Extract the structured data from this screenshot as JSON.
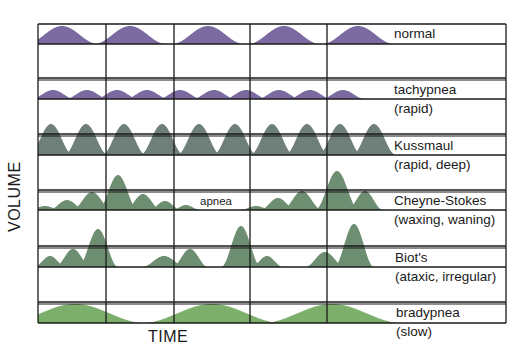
{
  "axes": {
    "x_label": "TIME",
    "y_label": "VOLUME"
  },
  "annotation": {
    "apnea": "apnea"
  },
  "colors": {
    "purple": "#7a6aa0",
    "slate": "#6f7f7a",
    "green_gray": "#6e8e72",
    "green": "#7cae6c",
    "grid": "#1a1a1a"
  },
  "patterns": [
    {
      "id": "normal",
      "name": "normal",
      "description": ""
    },
    {
      "id": "tachypnea",
      "name": "tachypnea",
      "description": "(rapid)"
    },
    {
      "id": "kussmaul",
      "name": "Kussmaul",
      "description": "(rapid, deep)"
    },
    {
      "id": "cheyne-stokes",
      "name": "Cheyne-Stokes",
      "description": "(waxing, waning)"
    },
    {
      "id": "biots",
      "name": "Biot's",
      "description": "(ataxic, irregular)"
    },
    {
      "id": "bradypnea",
      "name": "bradypnea",
      "description": "(slow)"
    }
  ],
  "chart_data": {
    "type": "diagram",
    "xlabel": "TIME",
    "ylabel": "VOLUME",
    "grid": true,
    "rows": [
      {
        "name": "normal",
        "description": "",
        "color": "#7a6aa0",
        "baseline_y": 44,
        "peaks": [
          [
            62,
            18,
            36
          ],
          [
            130,
            18,
            36
          ],
          [
            208,
            18,
            36
          ],
          [
            284,
            18,
            36
          ],
          [
            358,
            18,
            36
          ]
        ]
      },
      {
        "name": "tachypnea",
        "description": "(rapid)",
        "color": "#7a6aa0",
        "baseline_y": 99,
        "peaks": [
          [
            53,
            9,
            22
          ],
          [
            87,
            9,
            22
          ],
          [
            117,
            9,
            22
          ],
          [
            147,
            9,
            22
          ],
          [
            180,
            9,
            22
          ],
          [
            214,
            9,
            22
          ],
          [
            246,
            9,
            22
          ],
          [
            279,
            9,
            22
          ],
          [
            310,
            9,
            22
          ],
          [
            343,
            9,
            22
          ]
        ]
      },
      {
        "name": "Kussmaul",
        "description": "(rapid, deep)",
        "color": "#6f7f7a",
        "baseline_y": 155,
        "peaks": [
          [
            51,
            31,
            22
          ],
          [
            86,
            31,
            22
          ],
          [
            124,
            31,
            22
          ],
          [
            162,
            31,
            22
          ],
          [
            199,
            31,
            22
          ],
          [
            235,
            31,
            22
          ],
          [
            272,
            31,
            22
          ],
          [
            307,
            31,
            22
          ],
          [
            340,
            31,
            22
          ],
          [
            374,
            31,
            22
          ]
        ]
      },
      {
        "name": "Cheyne-Stokes",
        "description": "(waxing, waning)",
        "color": "#6e8e72",
        "baseline_y": 210,
        "peaks": [
          [
            45,
            4,
            16
          ],
          [
            67,
            10,
            18
          ],
          [
            92,
            18,
            20
          ],
          [
            118,
            35,
            20
          ],
          [
            143,
            16,
            18
          ],
          [
            165,
            9,
            16
          ],
          [
            186,
            5,
            14
          ],
          [
            256,
            4,
            16
          ],
          [
            278,
            12,
            18
          ],
          [
            302,
            19,
            20
          ],
          [
            337,
            39,
            22
          ],
          [
            365,
            19,
            18
          ]
        ]
      },
      {
        "name": "Biot's",
        "description": "(ataxic, irregular)",
        "color": "#6e8e72",
        "baseline_y": 267,
        "peaks": [
          [
            50,
            11,
            16
          ],
          [
            73,
            18,
            18
          ],
          [
            98,
            38,
            20
          ],
          [
            164,
            11,
            22
          ],
          [
            190,
            18,
            18
          ],
          [
            241,
            41,
            20
          ],
          [
            267,
            11,
            16
          ],
          [
            325,
            15,
            20
          ],
          [
            354,
            43,
            20
          ]
        ]
      },
      {
        "name": "bradypnea",
        "description": "(slow)",
        "color": "#7cae6c",
        "baseline_y": 323,
        "peaks": [
          [
            75,
            19,
            70
          ],
          [
            212,
            19,
            70
          ],
          [
            332,
            19,
            70
          ]
        ]
      }
    ],
    "grid_x": [
      38,
      106,
      174,
      250,
      327,
      506
    ],
    "apnea_annotation": "apnea"
  }
}
